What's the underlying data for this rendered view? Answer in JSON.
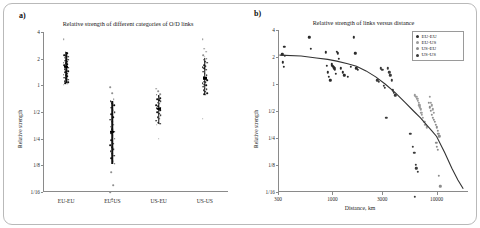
{
  "figure": {
    "panel_a_label": "a)",
    "panel_b_label": "b)"
  },
  "chart_data": [
    {
      "type": "scatter",
      "panel": "a",
      "title": "Relative strength of different categories of O/D links",
      "xlabel": "",
      "ylabel": "Relative strength",
      "yscale": "log2",
      "ylim": [
        0.0625,
        4
      ],
      "ytick_labels": [
        "4",
        "2",
        "1",
        "1/2",
        "1/4",
        "1/8",
        "1/16"
      ],
      "ytick_values": [
        4,
        2,
        1,
        0.5,
        0.25,
        0.125,
        0.0625
      ],
      "categories": [
        "EU-EU",
        "EU-US",
        "US-EU",
        "US-US"
      ],
      "grid": false,
      "legend": "none",
      "groups": [
        {
          "name": "EU-EU",
          "mean": 1.62,
          "ci_low": 1.05,
          "ci_high": 2.35,
          "values": [
            3.3,
            2.4,
            2.3,
            2.2,
            2.15,
            2.1,
            2.05,
            2.0,
            1.95,
            1.9,
            1.85,
            1.8,
            1.78,
            1.72,
            1.68,
            1.62,
            1.58,
            1.52,
            1.48,
            1.44,
            1.4,
            1.36,
            1.32,
            1.3,
            1.26,
            1.22,
            1.2,
            1.16,
            1.12,
            1.1,
            1.08,
            1.06,
            1.04,
            1.02
          ]
        },
        {
          "name": "EU-US",
          "mean": 0.3,
          "ci_low": 0.13,
          "ci_high": 0.66,
          "values": [
            0.95,
            0.82,
            0.7,
            0.66,
            0.63,
            0.6,
            0.56,
            0.52,
            0.5,
            0.47,
            0.44,
            0.41,
            0.39,
            0.36,
            0.34,
            0.32,
            0.3,
            0.29,
            0.27,
            0.25,
            0.24,
            0.22,
            0.21,
            0.2,
            0.19,
            0.18,
            0.17,
            0.16,
            0.15,
            0.14,
            0.13,
            0.105,
            0.075,
            0.062,
            0.052
          ]
        },
        {
          "name": "US-EU",
          "mean": 0.54,
          "ci_low": 0.37,
          "ci_high": 0.78,
          "values": [
            0.92,
            0.86,
            0.8,
            0.78,
            0.75,
            0.72,
            0.7,
            0.68,
            0.66,
            0.64,
            0.62,
            0.6,
            0.58,
            0.56,
            0.55,
            0.54,
            0.52,
            0.5,
            0.48,
            0.46,
            0.44,
            0.42,
            0.4,
            0.38,
            0.37,
            0.36,
            0.25
          ]
        },
        {
          "name": "US-US",
          "mean": 1.2,
          "ci_low": 0.78,
          "ci_high": 2.05,
          "values": [
            3.3,
            2.6,
            2.4,
            2.2,
            2.1,
            2.0,
            1.95,
            1.85,
            1.8,
            1.7,
            1.65,
            1.6,
            1.55,
            1.5,
            1.42,
            1.35,
            1.3,
            1.25,
            1.2,
            1.15,
            1.1,
            1.08,
            1.05,
            1.02,
            1.0,
            0.96,
            0.92,
            0.9,
            0.88,
            0.85,
            0.82,
            0.8,
            0.78,
            0.42
          ]
        }
      ]
    },
    {
      "type": "scatter",
      "panel": "b",
      "title": "Relative strength of links versus distance",
      "xlabel": "Distance, km",
      "ylabel": "Relative strength",
      "xscale": "log10",
      "yscale": "log2",
      "xlim": [
        300,
        20000
      ],
      "ylim": [
        0.0625,
        4
      ],
      "xtick_labels": [
        "300",
        "1000",
        "3000",
        "10000"
      ],
      "xtick_values": [
        300,
        1000,
        3000,
        10000
      ],
      "ytick_labels": [
        "4",
        "2",
        "1",
        "1/2",
        "1/4",
        "1/8",
        "1/16"
      ],
      "ytick_values": [
        4,
        2,
        1,
        0.5,
        0.25,
        0.125,
        0.0625
      ],
      "grid": false,
      "legend_position": "top-right",
      "legend_entries": [
        "EU-EU",
        "EU-US",
        "US-EU",
        "US-US"
      ],
      "series": [
        {
          "name": "EU-EU",
          "color": "#2b2b2b",
          "points": [
            [
              330,
              2.15
            ],
            [
              335,
              1.75
            ],
            [
              340,
              1.55
            ],
            [
              345,
              2.6
            ],
            [
              350,
              2.05
            ],
            [
              600,
              3.3
            ],
            [
              620,
              2.45
            ],
            [
              860,
              2.25
            ],
            [
              880,
              1.6
            ],
            [
              900,
              1.35
            ],
            [
              920,
              1.2
            ],
            [
              950,
              1.1
            ],
            [
              980,
              1.65
            ],
            [
              1000,
              1.6
            ],
            [
              1020,
              1.55
            ],
            [
              1040,
              1.5
            ],
            [
              1060,
              1.45
            ],
            [
              1080,
              1.3
            ],
            [
              1100,
              2.3
            ],
            [
              1120,
              2.2
            ],
            [
              1150,
              1.9
            ],
            [
              1200,
              1.5
            ],
            [
              1250,
              1.35
            ],
            [
              1300,
              1.25
            ],
            [
              1400,
              1.2
            ],
            [
              1500,
              1.55
            ],
            [
              1600,
              3.3
            ],
            [
              1650,
              2.2
            ],
            [
              1700,
              1.5
            ],
            [
              1750,
              1.45
            ]
          ]
        },
        {
          "name": "US-US",
          "color": "#3a3a3a",
          "points": [
            [
              2700,
              1.1
            ],
            [
              2800,
              1.05
            ],
            [
              2900,
              1.5
            ],
            [
              3000,
              1.45
            ],
            [
              3100,
              0.95
            ],
            [
              3200,
              0.9
            ],
            [
              3400,
              1.5
            ],
            [
              3500,
              1.35
            ],
            [
              3600,
              1.25
            ],
            [
              3700,
              1.1
            ],
            [
              3800,
              0.85
            ],
            [
              3900,
              0.8
            ],
            [
              4000,
              0.75
            ],
            [
              3300,
              0.42
            ],
            [
              5600,
              0.28
            ],
            [
              5900,
              0.2
            ],
            [
              6100,
              0.17
            ],
            [
              6300,
              0.125
            ],
            [
              6400,
              0.115
            ],
            [
              6600,
              0.105
            ],
            [
              6200,
              0.055
            ]
          ]
        },
        {
          "name": "EU-US",
          "color": "#9a9a9a",
          "points": [
            [
              6200,
              0.75
            ],
            [
              6400,
              0.72
            ],
            [
              6500,
              0.68
            ],
            [
              6600,
              0.65
            ],
            [
              6700,
              0.62
            ],
            [
              6800,
              0.58
            ],
            [
              6900,
              0.55
            ],
            [
              7000,
              0.52
            ],
            [
              7100,
              0.48
            ],
            [
              7200,
              0.45
            ],
            [
              7400,
              0.42
            ],
            [
              7600,
              0.38
            ],
            [
              7800,
              0.35
            ],
            [
              8000,
              0.33
            ],
            [
              8600,
              0.72
            ],
            [
              8800,
              0.62
            ],
            [
              9000,
              0.58
            ],
            [
              9200,
              0.52
            ],
            [
              9400,
              0.48
            ]
          ]
        },
        {
          "name": "US-EU",
          "color": "#8c8c8c",
          "points": [
            [
              8400,
              0.62
            ],
            [
              8600,
              0.55
            ],
            [
              8800,
              0.5
            ],
            [
              9000,
              0.45
            ],
            [
              9200,
              0.42
            ],
            [
              9400,
              0.4
            ],
            [
              9600,
              0.38
            ],
            [
              9800,
              0.35
            ],
            [
              10000,
              0.33
            ],
            [
              10200,
              0.3
            ],
            [
              10400,
              0.28
            ],
            [
              10600,
              0.26
            ],
            [
              9900,
              0.22
            ],
            [
              10100,
              0.2
            ],
            [
              10300,
              0.185
            ],
            [
              10500,
              0.095
            ],
            [
              10800,
              0.072
            ]
          ]
        }
      ],
      "fit_curve": {
        "label": "fitted trend",
        "points": [
          [
            310,
            2.1
          ],
          [
            500,
            2.05
          ],
          [
            700,
            1.95
          ],
          [
            900,
            1.88
          ],
          [
            1100,
            1.8
          ],
          [
            1400,
            1.68
          ],
          [
            1700,
            1.58
          ],
          [
            2100,
            1.4
          ],
          [
            2600,
            1.2
          ],
          [
            3200,
            1.0
          ],
          [
            4000,
            0.8
          ],
          [
            5000,
            0.62
          ],
          [
            6000,
            0.5
          ],
          [
            7000,
            0.42
          ],
          [
            8000,
            0.35
          ],
          [
            9000,
            0.3
          ],
          [
            10000,
            0.26
          ],
          [
            12000,
            0.17
          ],
          [
            14000,
            0.115
          ],
          [
            16000,
            0.085
          ],
          [
            18000,
            0.068
          ]
        ]
      }
    }
  ]
}
